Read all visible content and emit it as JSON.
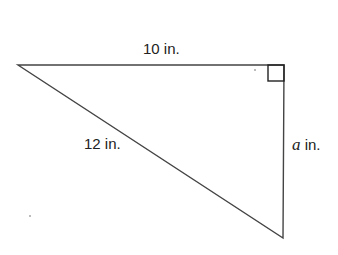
{
  "diagram": {
    "type": "right-triangle",
    "labels": {
      "top_side": "10 in.",
      "hypotenuse": "12 in.",
      "right_side_var": "a",
      "right_side_unit": " in."
    },
    "right_angle_marker": true,
    "colors": {
      "stroke": "#333333",
      "background": "#ffffff"
    }
  }
}
